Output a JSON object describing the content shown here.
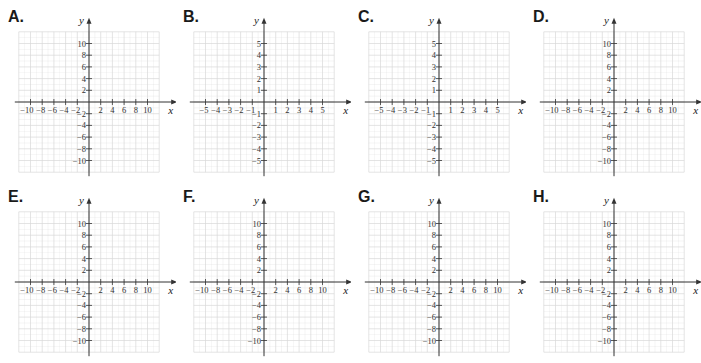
{
  "chart_data": [
    {
      "type": "grid",
      "label": "A.",
      "xlabel": "x",
      "ylabel": "y",
      "xlim": [
        -10,
        10
      ],
      "ylim": [
        -10,
        10
      ],
      "step": 2,
      "grid": true,
      "x_ticks": [
        -10,
        -8,
        -6,
        -4,
        -2,
        2,
        4,
        6,
        8,
        10
      ],
      "y_ticks": [
        10,
        8,
        6,
        4,
        2,
        -2,
        -4,
        -6,
        -8,
        -10
      ]
    },
    {
      "type": "grid",
      "label": "B.",
      "xlabel": "x",
      "ylabel": "y",
      "xlim": [
        -5,
        5
      ],
      "ylim": [
        -5,
        5
      ],
      "step": 1,
      "grid": true,
      "x_ticks": [
        -5,
        -4,
        -3,
        -2,
        -1,
        1,
        2,
        3,
        4,
        5
      ],
      "y_ticks": [
        5,
        4,
        3,
        2,
        1,
        -1,
        -2,
        -3,
        -4,
        -5
      ]
    },
    {
      "type": "grid",
      "label": "C.",
      "xlabel": "x",
      "ylabel": "y",
      "xlim": [
        -5,
        5
      ],
      "ylim": [
        -5,
        5
      ],
      "step": 1,
      "grid": true,
      "x_ticks": [
        -5,
        -4,
        -3,
        -2,
        -1,
        1,
        2,
        3,
        4,
        5
      ],
      "y_ticks": [
        5,
        4,
        3,
        2,
        1,
        -1,
        -2,
        -3,
        -4,
        -5
      ]
    },
    {
      "type": "grid",
      "label": "D.",
      "xlabel": "x",
      "ylabel": "y",
      "xlim": [
        -10,
        10
      ],
      "ylim": [
        -10,
        10
      ],
      "step": 2,
      "grid": true,
      "x_ticks": [
        -10,
        -8,
        -6,
        -4,
        -2,
        2,
        4,
        6,
        8,
        10
      ],
      "y_ticks": [
        10,
        8,
        6,
        4,
        2,
        -2,
        -4,
        -6,
        -8,
        -10
      ]
    },
    {
      "type": "grid",
      "label": "E.",
      "xlabel": "x",
      "ylabel": "y",
      "xlim": [
        -10,
        10
      ],
      "ylim": [
        -10,
        10
      ],
      "step": 2,
      "grid": true,
      "x_ticks": [
        -10,
        -8,
        -6,
        -4,
        -2,
        2,
        4,
        6,
        8,
        10
      ],
      "y_ticks": [
        10,
        8,
        6,
        4,
        2,
        -2,
        -4,
        -6,
        -8,
        -10
      ]
    },
    {
      "type": "grid",
      "label": "F.",
      "xlabel": "x",
      "ylabel": "y",
      "xlim": [
        -10,
        10
      ],
      "ylim": [
        -10,
        10
      ],
      "step": 2,
      "grid": true,
      "x_ticks": [
        -10,
        -8,
        -6,
        -4,
        -2,
        2,
        4,
        6,
        8,
        10
      ],
      "y_ticks": [
        10,
        8,
        6,
        4,
        2,
        -2,
        -4,
        -6,
        -8,
        -10
      ]
    },
    {
      "type": "grid",
      "label": "G.",
      "xlabel": "x",
      "ylabel": "y",
      "xlim": [
        -10,
        10
      ],
      "ylim": [
        -10,
        10
      ],
      "step": 2,
      "grid": true,
      "x_ticks": [
        -10,
        -8,
        -6,
        -4,
        -2,
        2,
        4,
        6,
        8,
        10
      ],
      "y_ticks": [
        10,
        8,
        6,
        4,
        2,
        -2,
        -4,
        -6,
        -8,
        -10
      ]
    },
    {
      "type": "grid",
      "label": "H.",
      "xlabel": "x",
      "ylabel": "y",
      "xlim": [
        -10,
        10
      ],
      "ylim": [
        -10,
        10
      ],
      "step": 2,
      "grid": true,
      "x_ticks": [
        -10,
        -8,
        -6,
        -4,
        -2,
        2,
        4,
        6,
        8,
        10
      ],
      "y_ticks": [
        10,
        8,
        6,
        4,
        2,
        -2,
        -4,
        -6,
        -8,
        -10
      ]
    }
  ],
  "colors": {
    "grid_line": "#d9d9d9",
    "axis_line": "#333333",
    "label_text": "#1a1a1a"
  }
}
